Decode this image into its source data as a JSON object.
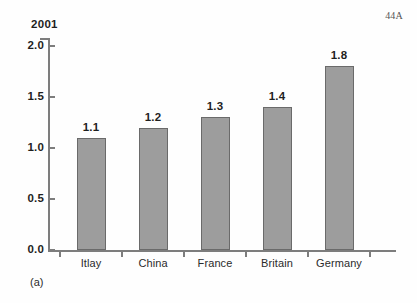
{
  "page": {
    "marker": "44A",
    "caption": "(a)"
  },
  "chart_data": {
    "type": "bar",
    "title": "2001",
    "xlabel": "",
    "ylabel": "",
    "categories": [
      "Itlay",
      "China",
      "France",
      "Britain",
      "Germany"
    ],
    "values": [
      1.1,
      1.2,
      1.3,
      1.4,
      1.8
    ],
    "value_labels": [
      "1.1",
      "1.2",
      "1.3",
      "1.4",
      "1.8"
    ],
    "ylim": [
      0.0,
      2.0
    ],
    "yticks": [
      0.0,
      0.5,
      1.0,
      1.5,
      2.0
    ],
    "ytick_labels": [
      "0.0",
      "0.5",
      "1.0",
      "1.5",
      "2.0"
    ],
    "grid": false,
    "legend": false,
    "bar_color": "#9d9d9d",
    "bar_border_color": "#6a6a6a",
    "axis_color": "#7d7d7d",
    "background": "#fefefe"
  }
}
